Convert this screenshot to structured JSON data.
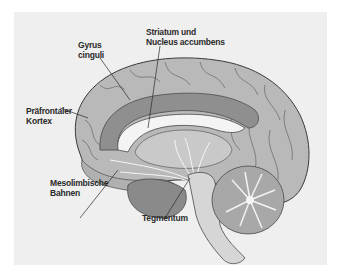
{
  "figure": {
    "background_color": "#efefef",
    "labels": [
      {
        "id": "gyrus-cinguli",
        "lines": [
          "Gyrus",
          "cinguli"
        ]
      },
      {
        "id": "striatum",
        "lines": [
          "Striatum und",
          "Nucleus accumbens"
        ]
      },
      {
        "id": "praefrontaler-kortex",
        "lines": [
          "Präfrontaler",
          "Kortex"
        ]
      },
      {
        "id": "mesolimbische-bahnen",
        "lines": [
          "Mesolimbische",
          "Bahnen"
        ]
      },
      {
        "id": "tegmentum",
        "lines": [
          "Tegmentum"
        ]
      }
    ],
    "colors": {
      "cortex": "#b9b9b9",
      "cortex_dark": "#8f8f8f",
      "cingulate": "#9a9a9a",
      "white_matter": "#f4f4f4",
      "brainstem": "#d6d6d6",
      "cerebellum": "#a8a8a8",
      "outline": "#3a3a3a",
      "text": "#2a2a2a"
    }
  }
}
